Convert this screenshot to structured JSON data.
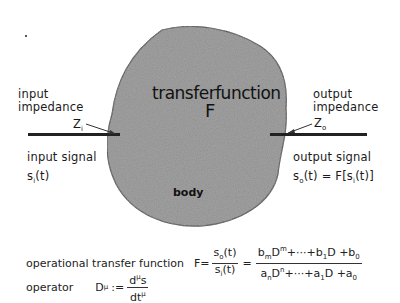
{
  "diagram": {
    "center": {
      "title": "transferfunction",
      "symbol": "F",
      "body_label": "body",
      "fill_color": "#8a8a8a"
    },
    "left": {
      "impedance_label_line1": "input",
      "impedance_label_line2": "impedance",
      "impedance_symbol": "Z",
      "impedance_subscript": "i",
      "signal_label": "input signal",
      "signal_expr": "s",
      "signal_sub": "i",
      "signal_arg": "(t)"
    },
    "right": {
      "impedance_label_line1": "output",
      "impedance_label_line2": "impedance",
      "impedance_symbol": "Z",
      "impedance_subscript": "o",
      "signal_label": "output signal",
      "signal_expr": "s",
      "signal_sub": "o",
      "signal_arg": "(t) = F[s",
      "signal_arg_sub": "i",
      "signal_arg_end": "(t)]"
    },
    "formulas": {
      "otf_label": "operational transfer function",
      "otf_lhs": "F=",
      "otf_frac1_num": "s",
      "otf_frac1_num_sub": "o",
      "otf_frac1_num_arg": "(t)",
      "otf_frac1_den": "s",
      "otf_frac1_den_sub": "i",
      "otf_frac1_den_arg": "(t)",
      "otf_eq": "=",
      "otf_frac2_num": "b_m D^m + ··· + b_1 D + b_0",
      "otf_frac2_den": "a_n D^n + ··· + a_1 D + a_0",
      "op_label": "operator",
      "op_lhs": "D",
      "op_lhs_sup": "μ",
      "op_assign": ":=",
      "op_num": "d",
      "op_num_sup": "μ",
      "op_num_end": "s",
      "op_den": "dt",
      "op_den_sup": "μ"
    }
  }
}
